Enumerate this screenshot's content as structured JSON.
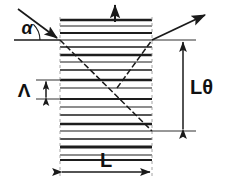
{
  "figure": {
    "kind": "optical-grating-diagram",
    "background": "#ffffff",
    "ink": "#1a1a1a"
  },
  "labels": {
    "alpha": "α",
    "lambda_period": "Λ",
    "width": "L",
    "height": "Lθ"
  },
  "grating": {
    "left_x": 60,
    "right_x": 152,
    "top_y": 17,
    "bottom_y": 160,
    "fringe_count": 17,
    "fringe_color": "#1d1d1d",
    "outline_color": "#1d1d1d"
  },
  "rays": {
    "incident": {
      "from_x": 18,
      "from_y": 9,
      "to_x": 60,
      "to_y": 40,
      "arrow": "solid",
      "style": "solid"
    },
    "transmitted": {
      "from_x": 60,
      "from_y": 40,
      "to_x": 152,
      "to_y": 131,
      "arrow": "none",
      "style": "dashed"
    },
    "diffracted": {
      "from_x": 117,
      "from_y": 88,
      "to_x": 208,
      "to_y": 13,
      "arrow": "solid",
      "style": "dashed-solid"
    },
    "up_arrow": {
      "x": 115,
      "from_y": 22,
      "to_y": 3,
      "arrow": "solid"
    }
  },
  "angle_mark": {
    "vertex_x": 18,
    "vertex_y": 40,
    "radius": 22,
    "baseline_from_x": 14,
    "baseline_to_x": 60,
    "baseline_y": 40
  },
  "dimensions": {
    "period": {
      "x": 46,
      "top_y": 80,
      "bottom_y": 99,
      "leader_left_x": 36,
      "leader_right_x": 60,
      "label_x": 26,
      "label_y": 96
    },
    "height": {
      "x": 183,
      "top_y": 40,
      "bottom_y": 131,
      "leader_left_x": 152,
      "leader_right_x": 196,
      "label_x": 190,
      "label_y": 93
    },
    "width": {
      "y": 172,
      "left_x": 60,
      "right_x": 152,
      "label_x": 106,
      "label_y": 168
    }
  }
}
